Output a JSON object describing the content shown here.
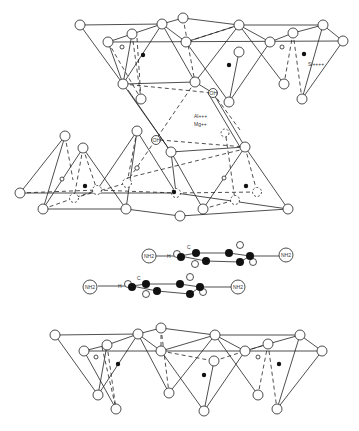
{
  "figure": {
    "labels": {
      "silicon": "Si++++",
      "aluminum": "Al+++",
      "magnesium": "Mg++",
      "hydroxyl_1": "OH",
      "hydroxyl_2": "OH",
      "molecule_1_left": "NH2",
      "molecule_1_right": "NH2",
      "molecule_1_h": "H",
      "molecule_1_c": "C",
      "molecule_2_left": "NH2",
      "molecule_2_right": "NH2",
      "molecule_2_h": "H",
      "molecule_2_c": "C"
    },
    "legend": {
      "open_circle": "oxygen",
      "filled_circle": "silicon / carbon"
    }
  }
}
